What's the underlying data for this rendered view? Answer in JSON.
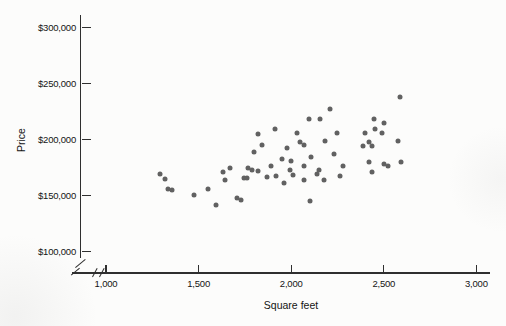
{
  "window": {
    "width": 506,
    "height": 326,
    "background": "#fcfcfb"
  },
  "chart_data": {
    "type": "scatter",
    "title": "",
    "xlabel": "Square feet",
    "ylabel": "Price",
    "legend": "none",
    "grid": false,
    "axis_break_at_origin": true,
    "x_range": [
      1000,
      3000
    ],
    "y_range": [
      100000,
      300000
    ],
    "x_ticks": [
      {
        "value": 1000,
        "label": "1,000"
      },
      {
        "value": 1500,
        "label": "1,500"
      },
      {
        "value": 2000,
        "label": "2,000"
      },
      {
        "value": 2500,
        "label": "2,500"
      },
      {
        "value": 3000,
        "label": "3,000"
      }
    ],
    "y_ticks": [
      {
        "value": 100000,
        "label": "$100,000"
      },
      {
        "value": 150000,
        "label": "$150,000"
      },
      {
        "value": 200000,
        "label": "$200,000"
      },
      {
        "value": 250000,
        "label": "$250,000"
      },
      {
        "value": 300000,
        "label": "$300,000"
      }
    ],
    "point_color": "#616161",
    "axis_color": "#2f2f2f",
    "points": [
      [
        1290,
        169500
      ],
      [
        1320,
        165000
      ],
      [
        1335,
        156000
      ],
      [
        1355,
        155000
      ],
      [
        1475,
        150500
      ],
      [
        1550,
        156000
      ],
      [
        1595,
        141500
      ],
      [
        1630,
        171000
      ],
      [
        1645,
        164000
      ],
      [
        1670,
        175000
      ],
      [
        1710,
        147500
      ],
      [
        1730,
        146000
      ],
      [
        1745,
        166000
      ],
      [
        1760,
        166000
      ],
      [
        1765,
        175000
      ],
      [
        1790,
        173000
      ],
      [
        1820,
        172000
      ],
      [
        1870,
        166500
      ],
      [
        1890,
        176000
      ],
      [
        1920,
        167500
      ],
      [
        1800,
        188500
      ],
      [
        1820,
        204500
      ],
      [
        1845,
        195500
      ],
      [
        1910,
        209000
      ],
      [
        1980,
        192000
      ],
      [
        2030,
        205500
      ],
      [
        2045,
        197500
      ],
      [
        2070,
        195500
      ],
      [
        2185,
        199000
      ],
      [
        2230,
        187500
      ],
      [
        2245,
        205500
      ],
      [
        2095,
        218000
      ],
      [
        2155,
        218000
      ],
      [
        2210,
        227000
      ],
      [
        1950,
        183000
      ],
      [
        1960,
        161500
      ],
      [
        1995,
        173000
      ],
      [
        2000,
        181000
      ],
      [
        2010,
        168500
      ],
      [
        2070,
        176000
      ],
      [
        2070,
        164000
      ],
      [
        2100,
        145000
      ],
      [
        2105,
        184500
      ],
      [
        2140,
        169500
      ],
      [
        2150,
        173000
      ],
      [
        2175,
        164000
      ],
      [
        2265,
        167000
      ],
      [
        2280,
        176500
      ],
      [
        2390,
        194500
      ],
      [
        2400,
        205500
      ],
      [
        2420,
        198000
      ],
      [
        2420,
        179500
      ],
      [
        2435,
        194000
      ],
      [
        2435,
        171000
      ],
      [
        2445,
        218000
      ],
      [
        2450,
        209000
      ],
      [
        2490,
        205500
      ],
      [
        2500,
        214500
      ],
      [
        2500,
        178500
      ],
      [
        2520,
        176000
      ],
      [
        2575,
        199000
      ],
      [
        2585,
        238000
      ],
      [
        2595,
        179500
      ]
    ]
  }
}
